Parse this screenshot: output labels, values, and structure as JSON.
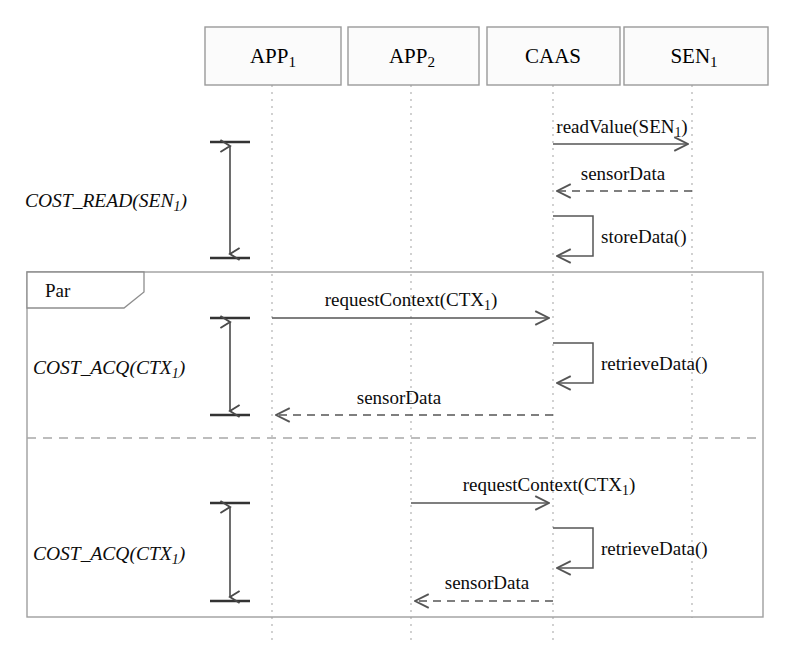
{
  "diagram": {
    "type": "uml-sequence-diagram",
    "background_color": "#ffffff",
    "line_color": "#555555",
    "box_fill": "#fbfbfb",
    "box_stroke": "#9a9a9a"
  },
  "lifelines": [
    {
      "id": "app1",
      "name": "APP",
      "subscript": "1",
      "x": 272,
      "box": {
        "x": 205,
        "y": 27,
        "w": 136,
        "h": 58
      }
    },
    {
      "id": "app2",
      "name": "APP",
      "subscript": "2",
      "x": 411,
      "box": {
        "x": 348,
        "y": 27,
        "w": 131,
        "h": 58
      }
    },
    {
      "id": "caas",
      "name": "CAAS",
      "subscript": "",
      "x": 553,
      "box": {
        "x": 487,
        "y": 27,
        "w": 133,
        "h": 58
      }
    },
    {
      "id": "sen1",
      "name": "SEN",
      "subscript": "1",
      "x": 692,
      "box": {
        "x": 624,
        "y": 27,
        "w": 144,
        "h": 58
      }
    }
  ],
  "messages": [
    {
      "id": "m1",
      "label": "readValue(SEN",
      "label_sub": "1",
      "label_tail": ")",
      "from": "caas",
      "to": "sen1",
      "style": "solid",
      "y": 144,
      "label_x": 622,
      "label_y": 133
    },
    {
      "id": "m2",
      "label": "sensorData",
      "label_sub": "",
      "label_tail": "",
      "from": "sen1",
      "to": "caas",
      "style": "dashed",
      "y": 191,
      "label_x": 623,
      "label_y": 180
    },
    {
      "id": "m3",
      "label": "storeData()",
      "label_sub": "",
      "label_tail": "",
      "from": "caas",
      "to": "caas",
      "style": "self",
      "y": 216,
      "y_end": 256,
      "label_x": 601,
      "label_y": 243
    },
    {
      "id": "m4",
      "label": "requestContext(CTX",
      "label_sub": "1",
      "label_tail": ")",
      "from": "app1",
      "to": "caas",
      "style": "solid",
      "y": 318,
      "label_x": 411,
      "label_y": 306
    },
    {
      "id": "m5",
      "label": "retrieveData()",
      "label_sub": "",
      "label_tail": "",
      "from": "caas",
      "to": "caas",
      "style": "self",
      "y": 343,
      "y_end": 383,
      "label_x": 601,
      "label_y": 370
    },
    {
      "id": "m6",
      "label": "sensorData",
      "label_sub": "",
      "label_tail": "",
      "from": "caas",
      "to": "app1",
      "style": "dashed",
      "y": 415,
      "label_x": 399,
      "label_y": 404
    },
    {
      "id": "m7",
      "label": "requestContext(CTX",
      "label_sub": "1",
      "label_tail": ")",
      "from": "app2",
      "to": "caas",
      "style": "solid",
      "y": 503,
      "label_x": 549,
      "label_y": 491
    },
    {
      "id": "m8",
      "label": "retrieveData()",
      "label_sub": "",
      "label_tail": "",
      "from": "caas",
      "to": "caas",
      "style": "self",
      "y": 528,
      "y_end": 568,
      "label_x": 601,
      "label_y": 555
    },
    {
      "id": "m9",
      "label": "sensorData",
      "label_sub": "",
      "label_tail": "",
      "from": "caas",
      "to": "app2",
      "style": "dashed",
      "y": 601,
      "label_x": 487,
      "label_y": 589
    }
  ],
  "fragment": {
    "operator": "Par",
    "x": 27,
    "y": 272,
    "w": 736,
    "h": 345,
    "divider_y": 438,
    "tab": {
      "w": 117,
      "h": 36
    }
  },
  "cost_annotations": [
    {
      "id": "cost-read",
      "label": "COST_READ(SEN",
      "label_sub": "1",
      "label_tail": ")",
      "bar_x": 230,
      "y_top": 142,
      "y_bottom": 258,
      "cap_halfwidth": 20,
      "label_x": 25,
      "label_y": 207
    },
    {
      "id": "cost-acq-1",
      "label": "COST_ACQ(CTX",
      "label_sub": "1",
      "label_tail": ")",
      "bar_x": 230,
      "y_top": 318,
      "y_bottom": 415,
      "cap_halfwidth": 20,
      "label_x": 33,
      "label_y": 374
    },
    {
      "id": "cost-acq-2",
      "label": "COST_ACQ(CTX",
      "label_sub": "1",
      "label_tail": ")",
      "bar_x": 230,
      "y_top": 503,
      "y_bottom": 601,
      "cap_halfwidth": 20,
      "label_x": 33,
      "label_y": 560
    }
  ]
}
